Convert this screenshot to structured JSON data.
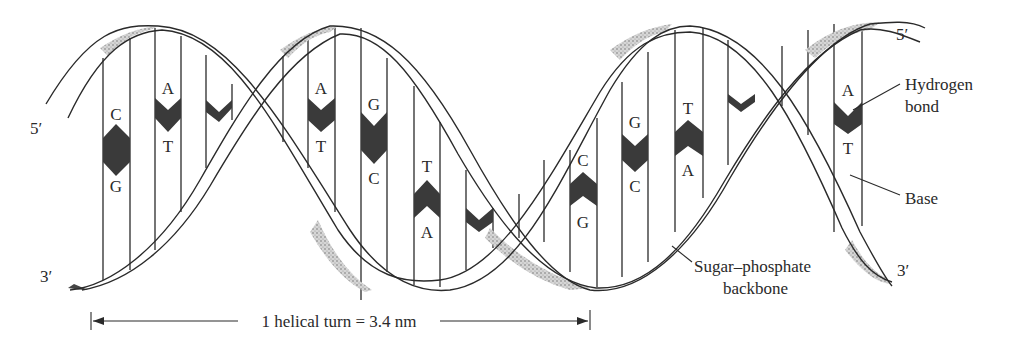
{
  "diagram": {
    "end_labels": {
      "top_left": "5′",
      "bottom_left": "3′",
      "top_right": "5′",
      "bottom_right": "3′"
    },
    "callouts": {
      "hydrogen_bond": [
        "Hydrogen",
        "bond"
      ],
      "base": "Base",
      "backbone": [
        "Sugar–phosphate",
        "backbone"
      ]
    },
    "measure": {
      "label": "1 helical turn = 3.4 nm"
    },
    "base_pairs": [
      {
        "top": "C",
        "bottom": "G"
      },
      {
        "top": "A",
        "bottom": "T"
      },
      {
        "top": "A",
        "bottom": "T"
      },
      {
        "top": "G",
        "bottom": "C"
      },
      {
        "top": "T",
        "bottom": "A"
      },
      {
        "top": "C",
        "bottom": "G"
      },
      {
        "top": "G",
        "bottom": "C"
      },
      {
        "top": "T",
        "bottom": "A"
      },
      {
        "top": "A",
        "bottom": "T"
      }
    ],
    "colors": {
      "ink": "#2a2a2a",
      "bond_fill": "#3a3a3a",
      "background": "#ffffff"
    }
  }
}
